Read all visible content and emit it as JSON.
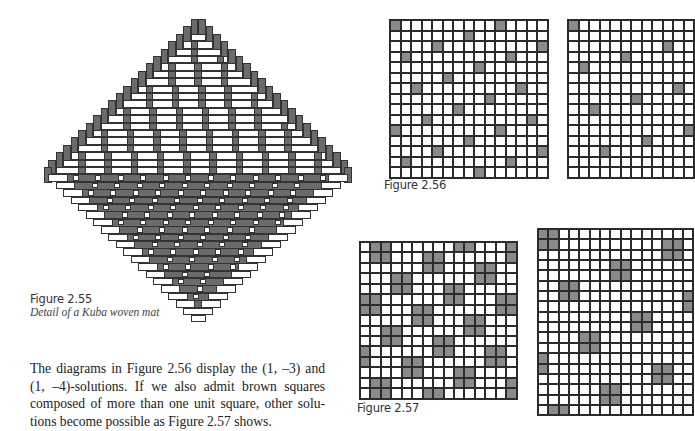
{
  "figures": {
    "fig_2_55": {
      "label": "Figure 2.55",
      "caption": "Detail of a Kuba woven mat",
      "kuba": {
        "center_x": 198,
        "top_y": 19,
        "half_rows": 20,
        "row_h": 7.4,
        "col_w": 7.5
      }
    },
    "fig_2_56": {
      "label": "Figure 2.56",
      "grids": [
        {
          "name": "(1,-3)-solution",
          "x": 389,
          "y": 19,
          "rows": 15,
          "cols": 15,
          "cell": 10.5,
          "block": 1,
          "rule": {
            "mult": -3,
            "offset": 0,
            "mod": 10
          }
        },
        {
          "name": "(1,-4)-solution",
          "x": 567,
          "y": 19,
          "rows": 15,
          "cols": 12,
          "cell": 10.5,
          "block": 1,
          "rule": {
            "mult": -4,
            "offset": 0,
            "mod": 17
          }
        }
      ]
    },
    "fig_2_57": {
      "label": "Figure 2.57",
      "grids": [
        {
          "name": "2x2-block solution A",
          "x": 359,
          "y": 241,
          "rows": 15,
          "cols": 15,
          "cell": 10.45,
          "block": 2,
          "rule": {
            "mult": 5,
            "offset": 1,
            "mod": 13
          }
        },
        {
          "name": "2x2-block solution B",
          "x": 537,
          "y": 228,
          "rows": 18,
          "cols": 15,
          "cell": 10.35,
          "block": 2,
          "rule": {
            "mult": 12,
            "offset": 0,
            "mod": 29
          }
        }
      ]
    }
  },
  "body_text": {
    "lines": [
      "The diagrams in Figure 2.56 display the (1, –3) and",
      "(1, –4)-solutions. If we also admit brown squares",
      "composed of more than one unit square, other solu-",
      "tions become possible as Figure 2.57 shows."
    ]
  },
  "colors": {
    "filled": "#8a8a8a",
    "grid_line": "#2b2b2b",
    "mat_dark": "#6b6b6b"
  }
}
